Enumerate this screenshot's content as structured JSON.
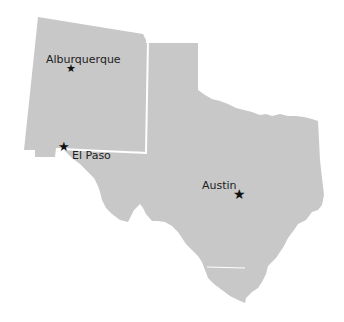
{
  "map": {
    "regions": [
      {
        "name": "New Mexico",
        "fill": "#c8c8c8"
      },
      {
        "name": "Texas",
        "fill": "#c8c8c8"
      }
    ],
    "border_color": "#ffffff",
    "background": "#ffffff"
  },
  "cities": [
    {
      "name": "Alburquerque",
      "marker": "star-icon",
      "x": 72,
      "y": 70
    },
    {
      "name": "El Paso",
      "marker": "star-icon",
      "x": 65,
      "y": 147
    },
    {
      "name": "Austin",
      "marker": "star-icon",
      "x": 240,
      "y": 194
    }
  ],
  "labels": {
    "city_0": "Alburquerque",
    "city_1": "El Paso",
    "city_2": "Austin"
  },
  "marker_glyph": "★"
}
